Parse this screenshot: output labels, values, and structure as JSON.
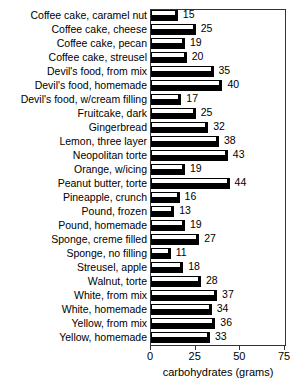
{
  "chart_data": {
    "type": "bar",
    "orientation": "horizontal",
    "title": "",
    "xlabel": "carbohydrates (grams)",
    "ylabel": "",
    "xlim": [
      0,
      75
    ],
    "xticks": [
      0,
      25,
      50,
      75
    ],
    "xtick_labels": [
      "0",
      "25",
      "50",
      "75"
    ],
    "grid": false,
    "legend": null,
    "categories": [
      "Coffee cake, caramel nut",
      "Coffee cake, cheese",
      "Coffee cake, pecan",
      "Coffee cake, streusel",
      "Devil's food, from mix",
      "Devil's food, homemade",
      "Devil's food, w/cream filling",
      "Fruitcake, dark",
      "Gingerbread",
      "Lemon, three layer",
      "Neopolitan torte",
      "Orange, w/icing",
      "Peanut butter, torte",
      "Pineapple, crunch",
      "Pound, frozen",
      "Pound, homemade",
      "Sponge, creme filled",
      "Sponge, no filling",
      "Streusel, apple",
      "Walnut, torte",
      "White, from mix",
      "White, homemade",
      "Yellow, from mix",
      "Yellow, homemade"
    ],
    "values": [
      15,
      25,
      19,
      20,
      35,
      40,
      17,
      25,
      32,
      38,
      43,
      19,
      44,
      16,
      13,
      19,
      27,
      11,
      18,
      28,
      37,
      34,
      36,
      33
    ],
    "value_labels": [
      "15",
      "25",
      "19",
      "20",
      "35",
      "40",
      "17",
      "25",
      "32",
      "38",
      "43",
      "19",
      "44",
      "16",
      "13",
      "19",
      "27",
      "11",
      "18",
      "28",
      "37",
      "34",
      "36",
      "33"
    ]
  },
  "style": {
    "bar_top_color": "#ffffff",
    "bar_front_color": "#000000",
    "bar_outline_color": "#000000",
    "axis_color": "#333333",
    "text_color": "#000000",
    "background": "#ffffff"
  }
}
